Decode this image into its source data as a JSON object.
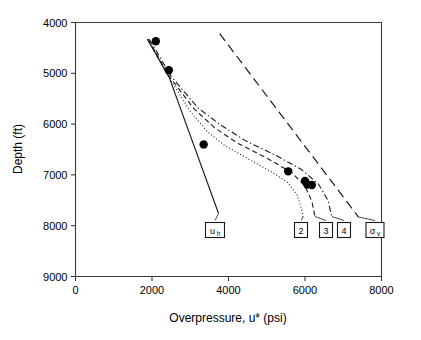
{
  "chart_data": {
    "type": "line",
    "title": "",
    "xlabel": "Overpressure, u* (psi)",
    "ylabel": "Depth (ft)",
    "xlim": [
      0,
      8000
    ],
    "ylim": [
      9000,
      4000
    ],
    "y_inverted": true,
    "grid": false,
    "legend_position": "inline-boxed-callouts",
    "xticks": [
      0,
      2000,
      4000,
      6000,
      8000
    ],
    "xtick_labels": [
      "0",
      "2000",
      "4000",
      "6000",
      "8000"
    ],
    "yticks": [
      4000,
      5000,
      6000,
      7000,
      8000,
      9000
    ],
    "ytick_labels": [
      "4000",
      "5000",
      "6000",
      "7000",
      "8000",
      "9000"
    ],
    "series": [
      {
        "name": "u_h",
        "label": "u",
        "sublabel": "h",
        "style": "solid",
        "x": [
          1880,
          2450,
          3740
        ],
        "y": [
          4330,
          5080,
          7760
        ]
      },
      {
        "name": "curve-2",
        "label": "2",
        "sublabel": "",
        "style": "dotted",
        "x": [
          1880,
          2430,
          3000,
          3450,
          3900,
          4500,
          5100,
          5550,
          5800,
          5900,
          5950
        ],
        "y": [
          4330,
          5060,
          5750,
          6150,
          6420,
          6680,
          6930,
          7150,
          7400,
          7650,
          7830
        ]
      },
      {
        "name": "curve-3",
        "label": "3",
        "sublabel": "",
        "style": "dashed",
        "x": [
          1900,
          2450,
          3100,
          3650,
          4250,
          5000,
          5650,
          6000,
          6180,
          6260
        ],
        "y": [
          4330,
          5060,
          5700,
          6080,
          6380,
          6670,
          6950,
          7220,
          7520,
          7820
        ]
      },
      {
        "name": "curve-4",
        "label": "4",
        "sublabel": "",
        "style": "dashdot",
        "x": [
          1930,
          2500,
          3200,
          3800,
          4450,
          5250,
          5900,
          6350,
          6600,
          6700
        ],
        "y": [
          4330,
          5060,
          5680,
          6020,
          6330,
          6620,
          6890,
          7180,
          7500,
          7820
        ]
      },
      {
        "name": "sigma_v",
        "label": "σ",
        "sublabel": "v",
        "style": "longdash",
        "x": [
          3770,
          7400
        ],
        "y": [
          4220,
          7830
        ]
      }
    ],
    "points": {
      "name": "measured-overpressure",
      "x": [
        2100,
        2440,
        3350,
        5560,
        6000,
        6060,
        6180
      ],
      "y": [
        4370,
        4940,
        6400,
        6930,
        7120,
        7190,
        7200
      ]
    },
    "callouts": [
      {
        "id": "callout-uh",
        "label": "u",
        "sublabel": "h"
      },
      {
        "id": "callout-2",
        "label": "2",
        "sublabel": ""
      },
      {
        "id": "callout-3",
        "label": "3",
        "sublabel": ""
      },
      {
        "id": "callout-4",
        "label": "4",
        "sublabel": ""
      },
      {
        "id": "callout-sigmav",
        "label": "σ",
        "sublabel": "v"
      }
    ],
    "colors": {
      "line": "#1a1a1a",
      "axis": "#3a3a3a",
      "marker": "#000000",
      "background": "#ffffff"
    }
  }
}
